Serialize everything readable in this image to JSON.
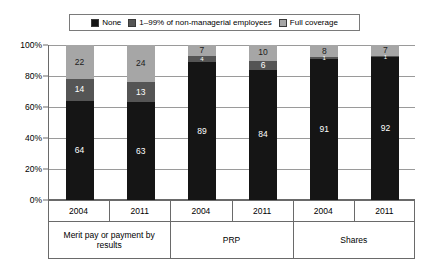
{
  "chart_data": {
    "type": "bar",
    "subtype": "100% stacked column",
    "title": "",
    "subtitle": "",
    "xlabel": "",
    "ylabel": "",
    "ylim": [
      0,
      100
    ],
    "ytick_labels": [
      "0%",
      "20%",
      "40%",
      "60%",
      "80%",
      "100%"
    ],
    "ytick_values": [
      0,
      20,
      40,
      60,
      80,
      100
    ],
    "grid": true,
    "legend_position": "top-center",
    "categories": [
      "2004",
      "2011",
      "2004",
      "2011",
      "2004",
      "2011"
    ],
    "groups": [
      {
        "label": "Merit pay or payment by results",
        "members": [
          "2004",
          "2011"
        ]
      },
      {
        "label": "PRP",
        "members": [
          "2004",
          "2011"
        ]
      },
      {
        "label": "Shares",
        "members": [
          "2004",
          "2011"
        ]
      }
    ],
    "series": [
      {
        "name": "None",
        "color": "#151515",
        "values": [
          64,
          63,
          89,
          84,
          91,
          92
        ]
      },
      {
        "name": "1–99% of non-managerial employees",
        "color": "#555555",
        "values": [
          14,
          13,
          4,
          6,
          1,
          1
        ]
      },
      {
        "name": "Full coverage",
        "color": "#a6a6a6",
        "values": [
          22,
          24,
          7,
          10,
          8,
          7
        ]
      }
    ]
  },
  "legend": {
    "items": [
      {
        "label": "None",
        "color": "#151515"
      },
      {
        "label": "1–99% of non-managerial employees",
        "color": "#555555"
      },
      {
        "label": "Full coverage",
        "color": "#a6a6a6"
      }
    ]
  },
  "bars": [
    {
      "group": "Merit pay or payment by results",
      "year": "2004",
      "segments": [
        {
          "series": "None",
          "value": 64,
          "label": "64"
        },
        {
          "series": "1–99% of non-managerial employees",
          "value": 14,
          "label": "14"
        },
        {
          "series": "Full coverage",
          "value": 22,
          "label": "22"
        }
      ]
    },
    {
      "group": "Merit pay or payment by results",
      "year": "2011",
      "segments": [
        {
          "series": "None",
          "value": 63,
          "label": "63"
        },
        {
          "series": "1–99% of non-managerial employees",
          "value": 13,
          "label": "13"
        },
        {
          "series": "Full coverage",
          "value": 24,
          "label": "24"
        }
      ]
    },
    {
      "group": "PRP",
      "year": "2004",
      "segments": [
        {
          "series": "None",
          "value": 89,
          "label": "89"
        },
        {
          "series": "1–99% of non-managerial employees",
          "value": 4,
          "label": "4"
        },
        {
          "series": "Full coverage",
          "value": 7,
          "label": "7"
        }
      ]
    },
    {
      "group": "PRP",
      "year": "2011",
      "segments": [
        {
          "series": "None",
          "value": 84,
          "label": "84"
        },
        {
          "series": "1–99% of non-managerial employees",
          "value": 6,
          "label": "6"
        },
        {
          "series": "Full coverage",
          "value": 10,
          "label": "10"
        }
      ]
    },
    {
      "group": "Shares",
      "year": "2004",
      "segments": [
        {
          "series": "None",
          "value": 91,
          "label": "91"
        },
        {
          "series": "1–99% of non-managerial employees",
          "value": 1,
          "label": "1"
        },
        {
          "series": "Full coverage",
          "value": 8,
          "label": "8"
        }
      ]
    },
    {
      "group": "Shares",
      "year": "2011",
      "segments": [
        {
          "series": "None",
          "value": 92,
          "label": "92"
        },
        {
          "series": "1–99% of non-managerial employees",
          "value": 1,
          "label": "1"
        },
        {
          "series": "Full coverage",
          "value": 7,
          "label": "7"
        }
      ]
    }
  ],
  "xaxis": {
    "year_labels": [
      "2004",
      "2011",
      "2004",
      "2011",
      "2004",
      "2011"
    ],
    "group_labels": [
      "Merit pay or payment by results",
      "PRP",
      "Shares"
    ]
  }
}
